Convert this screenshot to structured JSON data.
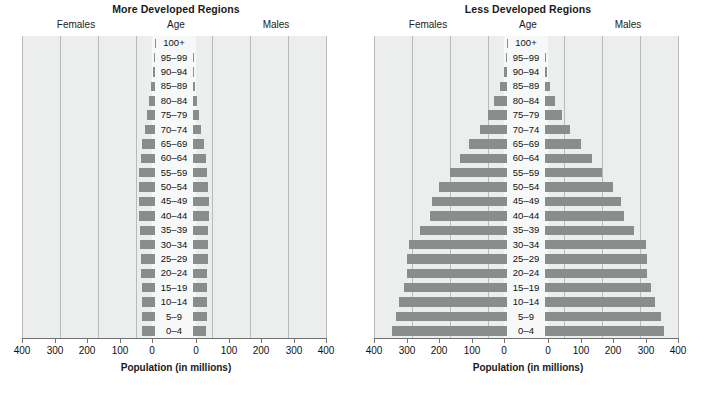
{
  "figure": {
    "axis_title": "Population (in millions)",
    "headers": {
      "females": "Females",
      "age": "Age",
      "males": "Males"
    },
    "tick_labels_left": [
      "400",
      "300",
      "200",
      "100",
      "0"
    ],
    "tick_labels_right": [
      "0",
      "100",
      "200",
      "300",
      "400"
    ],
    "bar_color": "#8b8c8d",
    "plot_background": "#eceded",
    "gridline_color": "#b9babb"
  },
  "chart_data": [
    {
      "type": "bar",
      "title": "More Developed Regions",
      "xlabel": "Population (in millions)",
      "ylabel": "Age",
      "xlim": [
        -400,
        400
      ],
      "axis_ticks": [
        400,
        300,
        200,
        100,
        0,
        0,
        100,
        200,
        300,
        400
      ],
      "grid": true,
      "legend": [
        "Females",
        "Males"
      ],
      "legend_position": "top",
      "categories": [
        "100+",
        "95–99",
        "90–94",
        "85–89",
        "80–84",
        "75–79",
        "70–74",
        "65–69",
        "60–64",
        "55–59",
        "50–54",
        "45–49",
        "40–44",
        "35–39",
        "30–34",
        "25–29",
        "20–24",
        "15–19",
        "10–14",
        "5–9",
        "0–4"
      ],
      "series": [
        {
          "name": "Females",
          "values": [
            0.3,
            2,
            5,
            10,
            17,
            22,
            27,
            33,
            38,
            41,
            42,
            42,
            41,
            39,
            39,
            38,
            36,
            35,
            35,
            34,
            33
          ]
        },
        {
          "name": "Males",
          "values": [
            0.1,
            0.8,
            2,
            5,
            10,
            15,
            21,
            28,
            34,
            38,
            40,
            41,
            41,
            39,
            39,
            39,
            38,
            37,
            37,
            36,
            35
          ]
        }
      ]
    },
    {
      "type": "bar",
      "title": "Less Developed Regions",
      "xlabel": "Population (in millions)",
      "ylabel": "Age",
      "xlim": [
        -400,
        400
      ],
      "axis_ticks": [
        400,
        300,
        200,
        100,
        0,
        0,
        100,
        200,
        300,
        400
      ],
      "grid": true,
      "legend": [
        "Females",
        "Males"
      ],
      "legend_position": "top",
      "categories": [
        "100+",
        "95–99",
        "90–94",
        "85–89",
        "80–84",
        "75–79",
        "70–74",
        "65–69",
        "60–64",
        "55–59",
        "50–54",
        "45–49",
        "40–44",
        "35–39",
        "30–34",
        "25–29",
        "20–24",
        "15–19",
        "10–14",
        "5–9",
        "0–4"
      ],
      "series": [
        {
          "name": "Females",
          "values": [
            0.4,
            3,
            8,
            18,
            33,
            50,
            72,
            100,
            125,
            150,
            178,
            197,
            203,
            228,
            258,
            262,
            262,
            272,
            283,
            292,
            302
          ]
        },
        {
          "name": "Males",
          "values": [
            0.2,
            2,
            6,
            14,
            27,
            44,
            66,
            96,
            124,
            150,
            180,
            200,
            208,
            234,
            265,
            268,
            268,
            278,
            290,
            305,
            313
          ]
        }
      ]
    }
  ]
}
